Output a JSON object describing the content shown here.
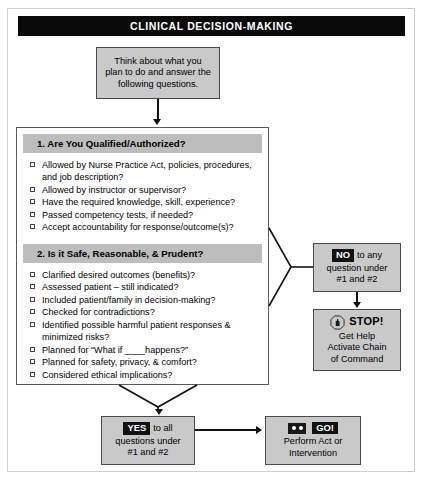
{
  "header": {
    "title": "CLINICAL DECISION-MAKING"
  },
  "intro": {
    "line1": "Think about what you",
    "line2": "plan to do and answer the",
    "line3": "following questions."
  },
  "main_panel": {
    "sections": [
      {
        "heading": "1. Are You Qualified/Authorized?",
        "items": [
          "Allowed by Nurse Practice Act, policies, procedures, and job description?",
          "Allowed by instructor or supervisor?",
          "Have the required knowledge, skill, experience?",
          "Passed competency tests, if needed?",
          "Accept accountability for response/outcome(s)?"
        ]
      },
      {
        "heading": "2. Is it Safe, Reasonable, & Prudent?",
        "items": [
          "Clarified desired outcomes (benefits)?",
          "Assessed patient – still indicated?",
          "Included patient/family in decision-making?",
          "Checked for contradictions?",
          "Identified possible harmful patient responses & minimized risks?",
          "Planned for “What if ____happens?”",
          "Planned for safety, privacy, & comfort?",
          "Considered ethical implications?"
        ]
      }
    ]
  },
  "no_branch": {
    "chip": "NO",
    "line1_rest": "to any",
    "line2": "question under",
    "line3": "#1 and #2"
  },
  "stop_node": {
    "icon": "stop-hand-octagon-icon",
    "word": "STOP!",
    "line2": "Get Help",
    "line3": "Activate Chain",
    "line4": "of Command"
  },
  "yes_branch": {
    "chip": "YES",
    "line1_rest": "to all",
    "line2": "questions under",
    "line3": "#1 and #2"
  },
  "go_node": {
    "icon": "traffic-face-icon",
    "chip": "GO!",
    "line2": "Perform Act or",
    "line3": "Intervention"
  },
  "colors": {
    "title_bar_bg": "#0a0a0a",
    "box_fill": "#c9c9c9",
    "section_heading_bg": "#bdbdbd",
    "border": "#4a4a4a",
    "connector": "#111111"
  }
}
